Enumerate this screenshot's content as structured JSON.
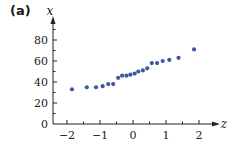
{
  "panel_label": "(a)",
  "chart_data": {
    "type": "scatter",
    "title": "",
    "xlabel": "z",
    "ylabel": "x",
    "xlim": [
      -2.4,
      2.6
    ],
    "ylim": [
      0,
      95
    ],
    "xticks": [
      -2,
      -1,
      0,
      1,
      2
    ],
    "yticks": [
      0,
      20,
      40,
      60,
      80
    ],
    "xtick_labels": [
      "−2",
      "−1",
      "0",
      "1",
      "2"
    ],
    "ytick_labels": [
      "0",
      "20",
      "40",
      "60",
      "80"
    ],
    "grid": false,
    "legend": null,
    "point_color": "#3d5a9e",
    "points": [
      {
        "z": -1.85,
        "x": 33
      },
      {
        "z": -1.4,
        "x": 35
      },
      {
        "z": -1.12,
        "x": 35
      },
      {
        "z": -0.92,
        "x": 36
      },
      {
        "z": -0.75,
        "x": 38
      },
      {
        "z": -0.6,
        "x": 38
      },
      {
        "z": -0.45,
        "x": 44
      },
      {
        "z": -0.33,
        "x": 46
      },
      {
        "z": -0.2,
        "x": 46
      },
      {
        "z": -0.08,
        "x": 47
      },
      {
        "z": 0.05,
        "x": 48
      },
      {
        "z": 0.16,
        "x": 50
      },
      {
        "z": 0.3,
        "x": 51
      },
      {
        "z": 0.43,
        "x": 53
      },
      {
        "z": 0.57,
        "x": 58
      },
      {
        "z": 0.73,
        "x": 58
      },
      {
        "z": 0.9,
        "x": 60
      },
      {
        "z": 1.1,
        "x": 61
      },
      {
        "z": 1.38,
        "x": 63
      },
      {
        "z": 1.85,
        "x": 71
      }
    ]
  }
}
